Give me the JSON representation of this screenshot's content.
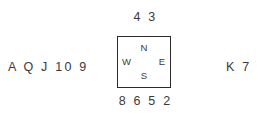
{
  "diagram": {
    "type": "bridge-hand-compass-diagram",
    "background_color": "#ffffff",
    "line_color": "#2b2b2b",
    "text_color": "#3a3a3a"
  },
  "compass": {
    "north_label": "N",
    "south_label": "S",
    "west_label": "W",
    "east_label": "E"
  },
  "hands": {
    "north": "4 3",
    "south": "8 6 5 2",
    "west": "A Q J 10 9",
    "east": "K 7"
  }
}
